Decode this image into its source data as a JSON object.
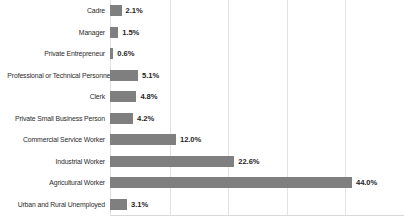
{
  "chart_data": {
    "type": "bar",
    "orientation": "horizontal",
    "title": "",
    "subtitle": "",
    "xlabel": "",
    "ylabel": "",
    "xlim": [
      0,
      53.5
    ],
    "grid": true,
    "grid_axis": "x",
    "legend": false,
    "legend_position": "none",
    "tick_labels_visible": false,
    "gridline_values": [
      10.9,
      21.5,
      32.2,
      42.7
    ],
    "bar_color": "#7f7f7f",
    "gridline_color": "#e3e3e3",
    "axis_color": "#d8d8d8",
    "label_color": "#2b2b2b",
    "value_label_color": "#1f1f1f",
    "value_label_suffix": "%",
    "categories": [
      "Cadre",
      "Manager",
      "Private Entrepreneur",
      "Professional or Technical Personnel",
      "Clerk",
      "Private Small Business Person",
      "Commercial Service Worker",
      "Industrial Worker",
      "Agricultural Worker",
      "Urban and Rural Unemployed"
    ],
    "values": [
      2.1,
      1.5,
      0.6,
      5.1,
      4.8,
      4.2,
      12.0,
      22.6,
      44.0,
      3.1
    ],
    "value_labels": [
      "2.1%",
      "1.5%",
      "0.6%",
      "5.1%",
      "4.8%",
      "4.2%",
      "12.0%",
      "22.6%",
      "44.0%",
      "3.1%"
    ]
  }
}
